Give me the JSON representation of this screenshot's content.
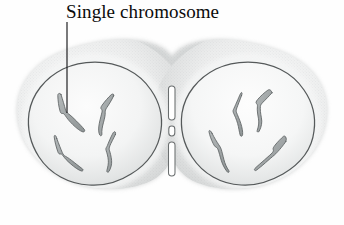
{
  "figure": {
    "title_label": "Single chromosome",
    "diagram_name": "dividing-cell-telophase",
    "background_color": "#fefefe",
    "palette": {
      "cytoplasm_outer": "#cdcfcf",
      "cytoplasm_inner": "#e9eaea",
      "cytoplasm_highlight": "#f7f8f8",
      "nucleus_outline": "#55595a",
      "nucleus_fill_center": "#fbfbfb",
      "nucleus_fill_edge": "#dcdede",
      "chromosome_fill": "#a3a8a9",
      "chromosome_stroke": "#5d6263",
      "furrow_fill": "#ffffff",
      "furrow_stroke": "#6a6e6f",
      "leader_line": "#17171a",
      "text_color": "#0b0b0b"
    },
    "leader_line": {
      "x": 67,
      "y_start": 22,
      "y_end": 113
    },
    "cells": [
      {
        "name": "left-daughter-cell",
        "nucleus": {
          "cx": 95,
          "cy": 124,
          "rx": 67,
          "ry": 62
        },
        "chromosome_count": 4,
        "chromosomes": [
          {
            "id": "left-chromosome-1",
            "shape": "bent-rod",
            "path": "M 62 96 L 66 110 L 69 113 L 78 123 L 84 129"
          },
          {
            "id": "left-chromosome-2",
            "shape": "bent-rod",
            "path": "M 112 97 L 106 107 L 104 113 L 101 124 L 102 134"
          },
          {
            "id": "left-chromosome-3",
            "shape": "v-shaped",
            "path": "M 58 140 L 63 152 L 66 156 L 75 164 L 82 168"
          },
          {
            "id": "left-chromosome-4",
            "shape": "s-curved",
            "path": "M 114 136 L 110 145 L 109 150 L 111 160 L 108 170"
          }
        ]
      },
      {
        "name": "right-daughter-cell",
        "nucleus": {
          "cx": 248,
          "cy": 124,
          "rx": 67,
          "ry": 62
        },
        "chromosome_count": 4,
        "chromosomes": [
          {
            "id": "right-chromosome-1",
            "shape": "bent-rod",
            "path": "M 240 97 L 238 108 L 236 113 L 241 124 L 242 135"
          },
          {
            "id": "right-chromosome-2",
            "shape": "bent-rod",
            "path": "M 270 94 L 262 102 L 259 107 L 261 120 L 256 132"
          },
          {
            "id": "right-chromosome-3",
            "shape": "v-shaped",
            "path": "M 213 135 L 219 143 L 222 147 L 224 158 L 228 168"
          },
          {
            "id": "right-chromosome-4",
            "shape": "bent-rod",
            "path": "M 284 143 L 277 151 L 274 155 L 266 164 L 259 170"
          }
        ]
      }
    ],
    "cleavage_furrow": {
      "name": "cleavage-furrow-midbody",
      "x_center": 172,
      "segments": [
        {
          "id": "furrow-segment-top",
          "y": 86,
          "height": 34
        },
        {
          "id": "furrow-segment-middle",
          "y": 126,
          "height": 10
        },
        {
          "id": "furrow-segment-bottom",
          "y": 142,
          "height": 34
        }
      ]
    }
  }
}
